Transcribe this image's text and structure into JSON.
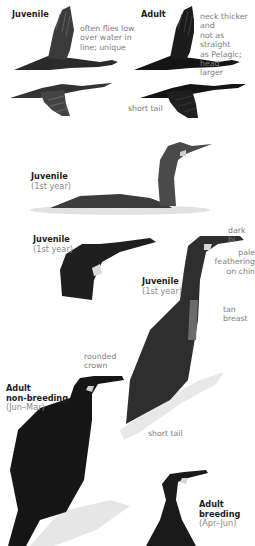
{
  "plate": {
    "labels": {
      "flight_juvenile": {
        "title": "Juvenile"
      },
      "flight_adult": {
        "title": "Adult"
      },
      "swimming_juvenile": {
        "title": "Juvenile",
        "sub": "(1st year)"
      },
      "head_juvenile": {
        "title": "Juvenile",
        "sub": "(1st year)"
      },
      "standing_juvenile": {
        "title": "Juvenile",
        "sub": "(1st year)"
      },
      "adult_nonbreeding": {
        "title1": "Adult",
        "title2": "non-breeding",
        "sub": "(Jun–Mar)"
      },
      "adult_breeding": {
        "title1": "Adult",
        "title2": "breeding",
        "sub": "(Apr–Jun)"
      }
    },
    "notes": {
      "flight_juvenile": [
        "often flies low",
        "over water in",
        "line; unique"
      ],
      "flight_adult": [
        "neck thicker and",
        "not as straight",
        "as Pelagic; head",
        "larger"
      ],
      "flight_tail": "short tail",
      "dark_bill": "dark bi",
      "pale_chin": [
        "pale",
        "feathering",
        "on chin"
      ],
      "tan_breast": [
        "tan",
        "breast"
      ],
      "rounded_crown": [
        "rounded",
        "crown"
      ],
      "short_tail_perched": "short tail"
    },
    "colors": {
      "plumage_dark": "#1a1a1a",
      "plumage_mid": "#3a3a3a",
      "juvenile_grey": "#4a4a4a",
      "pale_patch": "#d8d8d8",
      "rock": "#e6e6e6",
      "water": "#dcdcdc"
    }
  }
}
